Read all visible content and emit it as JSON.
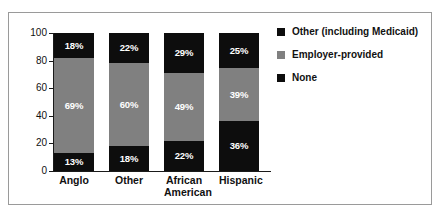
{
  "figure": {
    "border_color": "#9a9a9a",
    "background": "#ffffff"
  },
  "colors": {
    "none_color": "#0d0d0d",
    "employer_color": "#808080",
    "other_color": "#0d0d0d",
    "axis_color": "#1a1a1a",
    "label_color": "#111111",
    "value_label_color": "#ffffff"
  },
  "axis": {
    "y_ticks": [
      "0",
      "20",
      "40",
      "60",
      "80",
      "100"
    ],
    "y_tick_values": [
      0,
      20,
      40,
      60,
      80,
      100
    ]
  },
  "legend": {
    "items": [
      {
        "label": "Other (including Medicaid)",
        "swatch": "#0d0d0d",
        "swatch_name": "legend-swatch-other"
      },
      {
        "label": "Employer-provided",
        "swatch": "#808080",
        "swatch_name": "legend-swatch-employer"
      },
      {
        "label": "None",
        "swatch": "#0d0d0d",
        "swatch_name": "legend-swatch-none"
      }
    ]
  },
  "bars": [
    {
      "category_line1": "Anglo",
      "category_line2": "",
      "none": {
        "value": 13,
        "label": "13%"
      },
      "employer": {
        "value": 69,
        "label": "69%"
      },
      "other": {
        "value": 18,
        "label": "18%"
      }
    },
    {
      "category_line1": "Other",
      "category_line2": "",
      "none": {
        "value": 18,
        "label": "18%"
      },
      "employer": {
        "value": 60,
        "label": "60%"
      },
      "other": {
        "value": 22,
        "label": "22%"
      }
    },
    {
      "category_line1": "African",
      "category_line2": "American",
      "none": {
        "value": 22,
        "label": "22%"
      },
      "employer": {
        "value": 49,
        "label": "49%"
      },
      "other": {
        "value": 29,
        "label": "29%"
      }
    },
    {
      "category_line1": "Hispanic",
      "category_line2": "",
      "none": {
        "value": 36,
        "label": "36%"
      },
      "employer": {
        "value": 39,
        "label": "39%"
      },
      "other": {
        "value": 25,
        "label": "25%"
      }
    }
  ],
  "chart_data": {
    "type": "bar",
    "subtype": "stacked-bar-100-percent",
    "title": "",
    "subtitle": "",
    "xlabel": "",
    "ylabel": "",
    "ylim": [
      0,
      100
    ],
    "yticks": [
      0,
      20,
      40,
      60,
      80,
      100
    ],
    "grid": false,
    "legend_position": "right",
    "categories": [
      "Anglo",
      "Other",
      "African American",
      "Hispanic"
    ],
    "series": [
      {
        "name": "None",
        "color": "#0d0d0d",
        "values": [
          13,
          18,
          22,
          36
        ],
        "labels": [
          "13%",
          "18%",
          "22%",
          "36%"
        ],
        "stack_order": 1
      },
      {
        "name": "Employer-provided",
        "color": "#808080",
        "values": [
          69,
          60,
          49,
          39
        ],
        "labels": [
          "69%",
          "60%",
          "49%",
          "39%"
        ],
        "stack_order": 2
      },
      {
        "name": "Other (including Medicaid)",
        "color": "#0d0d0d",
        "values": [
          18,
          22,
          29,
          25
        ],
        "labels": [
          "18%",
          "22%",
          "29%",
          "25%"
        ],
        "stack_order": 3
      }
    ],
    "units": "percent"
  }
}
